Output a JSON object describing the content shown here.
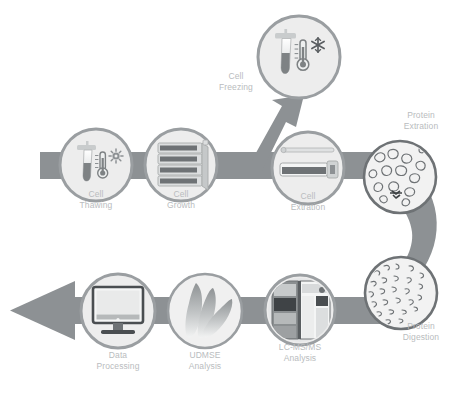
{
  "diagram": {
    "type": "process-flow",
    "orientation": "serpentine-left-to-right-then-right-to-left",
    "colors": {
      "ribbon": "#8d9194",
      "node_ring": "#9a9ea1",
      "node_fill": "#ededed",
      "label_text": "#b9bcbe",
      "background": "#ffffff",
      "icon_dark": "#5a5e61",
      "icon_mid": "#9a9ea1",
      "icon_light": "#d5d7d8"
    },
    "steps": [
      {
        "id": "cell-thawing",
        "label": "Cell\nThawing",
        "icon": "tube-thermometer-sun-icon",
        "row": "top",
        "order": 1,
        "cx": 96,
        "cy": 165,
        "r": 36,
        "label_x": 96,
        "label_y": 194
      },
      {
        "id": "cell-growth",
        "label": "Cell\nGrowth",
        "icon": "stacked-culture-flasks-icon",
        "row": "top",
        "order": 2,
        "cx": 181,
        "cy": 165,
        "r": 36,
        "label_x": 181,
        "label_y": 194
      },
      {
        "id": "cell-freezing",
        "label": "Cell\nFreezing",
        "icon": "tube-thermometer-snowflake-icon",
        "row": "branch",
        "order": 3,
        "cx": 299,
        "cy": 57,
        "r": 41,
        "label_x": 236,
        "label_y": 78
      },
      {
        "id": "cell-extration",
        "label": "Cell\nExtration",
        "icon": "cell-scraper-tube-icon",
        "row": "top",
        "order": 4,
        "cx": 308,
        "cy": 168,
        "r": 36,
        "label_x": 308,
        "label_y": 196
      },
      {
        "id": "protein-extration",
        "label": "Protein\nExtration",
        "icon": "folded-proteins-icon",
        "row": "top",
        "order": 5,
        "cx": 400,
        "cy": 177,
        "r": 37,
        "label_x": 421,
        "label_y": 116
      },
      {
        "id": "protein-digestion",
        "label": "Protein\nDigestion",
        "icon": "peptide-fragments-icon",
        "row": "bottom",
        "order": 6,
        "cx": 401,
        "cy": 293,
        "r": 37,
        "label_x": 421,
        "label_y": 327
      },
      {
        "id": "lc-msms-analysis",
        "label": "LC-MS/MS\nAnalysis",
        "icon": "mass-spectrometer-icon",
        "row": "bottom",
        "order": 7,
        "cx": 300,
        "cy": 310,
        "r": 35,
        "label_x": 300,
        "label_y": 348
      },
      {
        "id": "udmse-analysis",
        "label": "UDMSE\nAnalysis",
        "icon": "waters-petals-icon",
        "row": "bottom",
        "order": 8,
        "cx": 205,
        "cy": 311,
        "r": 38,
        "label_x": 205,
        "label_y": 355
      },
      {
        "id": "data-processing",
        "label": "Data\nProcessing",
        "icon": "desktop-monitor-icon",
        "row": "bottom",
        "order": 9,
        "cx": 118,
        "cy": 311,
        "r": 38,
        "label_x": 118,
        "label_y": 355
      }
    ],
    "connectors": [
      {
        "id": "top-ribbon",
        "from": "start",
        "to": "protein-extration",
        "style": "straight-bar"
      },
      {
        "id": "freeze-branch",
        "from": "cell-extration",
        "to": "cell-freezing",
        "style": "diagonal-arrow"
      },
      {
        "id": "right-s-curve",
        "from": "protein-extration",
        "to": "protein-digestion",
        "style": "curved-bend"
      },
      {
        "id": "bottom-ribbon",
        "from": "protein-digestion",
        "to": "data-processing",
        "style": "straight-bar"
      },
      {
        "id": "exit-arrowhead",
        "from": "data-processing",
        "to": "output",
        "style": "large-left-arrowhead"
      }
    ],
    "caption_partial": ""
  }
}
